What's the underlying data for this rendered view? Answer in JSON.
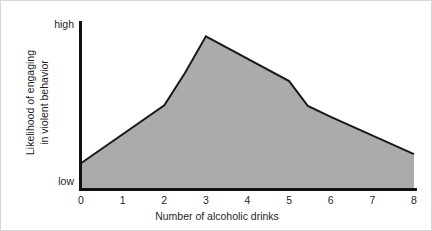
{
  "figure": {
    "background_color": "#ffffff",
    "border_color": "#d8d8d8"
  },
  "chart_data": {
    "type": "area",
    "title": "",
    "subtitle": "",
    "xlabel": "Number of alcoholic drinks",
    "ylabel": "Likelihood of engaging in violent behavior",
    "ylabel_line1": "Likelihood of engaging",
    "ylabel_line2": "in violent behavior",
    "x": [
      0,
      2,
      2.5,
      3,
      5,
      5.45,
      6,
      8
    ],
    "values": [
      0.155,
      0.505,
      0.7,
      0.92,
      0.65,
      0.5,
      0.435,
      0.21
    ],
    "xlim": [
      0,
      8
    ],
    "ylim": [
      0,
      1
    ],
    "xticks": [
      "0",
      "1",
      "2",
      "3",
      "4",
      "5",
      "6",
      "7",
      "8"
    ],
    "xtick_values": [
      0,
      1,
      2,
      3,
      4,
      5,
      6,
      7,
      8
    ],
    "yticks": [
      "low",
      "high"
    ],
    "ytick_values": [
      0,
      1
    ],
    "y_axis_low_label": "low",
    "y_axis_high_label": "high",
    "grid": false,
    "legend": false,
    "legend_position": "none",
    "series": [
      {
        "name": "Likelihood of violent behavior",
        "x": [
          0,
          2,
          2.5,
          3,
          5,
          5.45,
          6,
          8
        ],
        "values": [
          0.155,
          0.505,
          0.7,
          0.92,
          0.65,
          0.5,
          0.435,
          0.21
        ],
        "fill_color": "#ababab",
        "line_color": "#1a1a1a",
        "line_width": 2
      }
    ],
    "annotations": [],
    "axis_color": "#111111"
  }
}
